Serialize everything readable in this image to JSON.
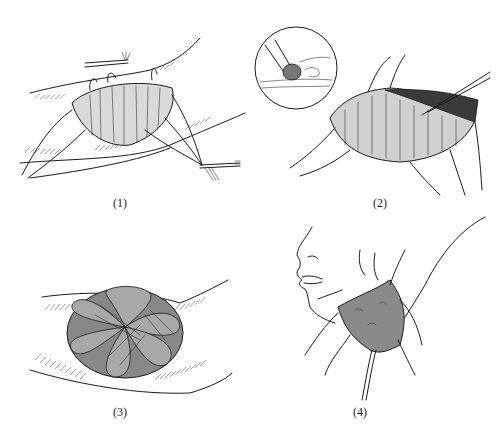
{
  "figure": {
    "panels": [
      {
        "id": 1,
        "label": "(1)",
        "depiction": "graft sutured over wound with long tie-over suture ends"
      },
      {
        "id": 2,
        "label": "(2)",
        "depiction": "graft edge lifted with forceps; circular inset showing detail"
      },
      {
        "id": 3,
        "label": "(3)",
        "depiction": "tied-over bolster dressing with lobed appearance"
      },
      {
        "id": 4,
        "label": "(4)",
        "depiction": "graft on face/jaw region with tie-over sutures"
      }
    ]
  },
  "colors": {
    "ink": "#1b1b1b",
    "background": "#ffffff"
  }
}
